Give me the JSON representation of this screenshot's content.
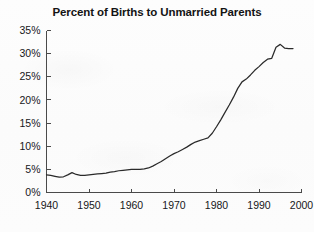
{
  "figure": {
    "title": "Percent of Births to Unmarried Parents",
    "background_color": "#fcfcfc",
    "line_color": "#2a2a2a",
    "axis_color": "#4a4a4a"
  },
  "chart_data": {
    "type": "line",
    "title": "Percent of Births to Unmarried Parents",
    "xlabel": "",
    "ylabel": "",
    "xlim": [
      1940,
      2000
    ],
    "ylim": [
      0,
      35
    ],
    "grid": false,
    "legend": "none",
    "x_tick_labels": [
      "1940",
      "1950",
      "1960",
      "1970",
      "1980",
      "1990",
      "2000"
    ],
    "x_ticks": [
      1940,
      1950,
      1960,
      1970,
      1980,
      1990,
      2000
    ],
    "y_tick_labels": [
      "0%",
      "5%",
      "10%",
      "15%",
      "20%",
      "25%",
      "30%",
      "35%"
    ],
    "y_ticks": [
      0,
      5,
      10,
      15,
      20,
      25,
      30,
      35
    ],
    "y_unit": "%",
    "series": [
      {
        "name": "Percent of births to unmarried parents",
        "x": [
          1940,
          1941,
          1942,
          1943,
          1944,
          1945,
          1946,
          1947,
          1948,
          1949,
          1950,
          1951,
          1952,
          1953,
          1954,
          1955,
          1956,
          1957,
          1958,
          1959,
          1960,
          1961,
          1962,
          1963,
          1964,
          1965,
          1966,
          1967,
          1968,
          1969,
          1970,
          1971,
          1972,
          1973,
          1974,
          1975,
          1976,
          1977,
          1978,
          1979,
          1980,
          1981,
          1982,
          1983,
          1984,
          1985,
          1986,
          1987,
          1988,
          1989,
          1990,
          1991,
          1992,
          1993,
          1994,
          1995,
          1996,
          1997,
          1998
        ],
        "values": [
          3.8,
          3.7,
          3.5,
          3.3,
          3.4,
          3.8,
          4.3,
          3.9,
          3.7,
          3.7,
          3.8,
          3.9,
          4.0,
          4.1,
          4.2,
          4.4,
          4.5,
          4.7,
          4.8,
          4.9,
          5.0,
          5.0,
          5.0,
          5.1,
          5.3,
          5.7,
          6.2,
          6.7,
          7.3,
          7.9,
          8.4,
          8.8,
          9.3,
          9.8,
          10.4,
          10.9,
          11.2,
          11.5,
          11.8,
          12.8,
          14.2,
          15.7,
          17.3,
          18.9,
          20.6,
          22.5,
          23.9,
          24.5,
          25.4,
          26.4,
          27.2,
          28.1,
          28.8,
          29.0,
          31.4,
          32.0,
          31.2,
          31.1,
          31.1
        ]
      }
    ],
    "annotations": [
      {
        "text": "Low, flat level near 4% through the 1940s and 1950s"
      },
      {
        "text": "Gradual rise begins in the mid-1960s"
      },
      {
        "text": "Steep climb from about 12% in 1978 to about 27% in 1990"
      },
      {
        "text": "Peak near 32% around 1994-1995, then a plateau near 31%"
      }
    ]
  }
}
